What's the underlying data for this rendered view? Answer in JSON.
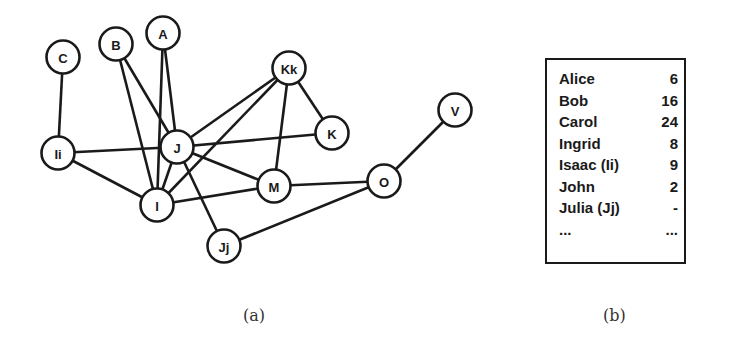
{
  "figure": {
    "panel_a": {
      "caption": "(a)",
      "nodes": [
        {
          "id": "C",
          "label": "C",
          "x": 63,
          "y": 57
        },
        {
          "id": "B",
          "label": "B",
          "x": 116,
          "y": 44
        },
        {
          "id": "A",
          "label": "A",
          "x": 163,
          "y": 33
        },
        {
          "id": "Ii",
          "label": "Ii",
          "x": 58,
          "y": 153
        },
        {
          "id": "J",
          "label": "J",
          "x": 177,
          "y": 147
        },
        {
          "id": "I",
          "label": "I",
          "x": 157,
          "y": 205
        },
        {
          "id": "Kk",
          "label": "Kk",
          "x": 289,
          "y": 68
        },
        {
          "id": "K",
          "label": "K",
          "x": 332,
          "y": 133
        },
        {
          "id": "M",
          "label": "M",
          "x": 274,
          "y": 186
        },
        {
          "id": "O",
          "label": "O",
          "x": 384,
          "y": 181
        },
        {
          "id": "V",
          "label": "V",
          "x": 455,
          "y": 110
        },
        {
          "id": "Jj",
          "label": "Jj",
          "x": 224,
          "y": 246
        }
      ],
      "edges": [
        [
          "C",
          "Ii"
        ],
        [
          "B",
          "J"
        ],
        [
          "B",
          "I"
        ],
        [
          "A",
          "J"
        ],
        [
          "A",
          "I"
        ],
        [
          "Ii",
          "J"
        ],
        [
          "Ii",
          "I"
        ],
        [
          "J",
          "Kk"
        ],
        [
          "J",
          "K"
        ],
        [
          "J",
          "M"
        ],
        [
          "J",
          "Jj"
        ],
        [
          "J",
          "I"
        ],
        [
          "I",
          "Kk"
        ],
        [
          "I",
          "M"
        ],
        [
          "Kk",
          "K"
        ],
        [
          "Kk",
          "M"
        ],
        [
          "M",
          "O"
        ],
        [
          "Jj",
          "O"
        ],
        [
          "O",
          "V"
        ]
      ]
    },
    "panel_b": {
      "caption": "(b)",
      "rows": [
        {
          "name": "Alice",
          "value": "6"
        },
        {
          "name": "Bob",
          "value": "16"
        },
        {
          "name": "Carol",
          "value": "24"
        },
        {
          "name": "Ingrid",
          "value": "8"
        },
        {
          "name": "Isaac (Ii)",
          "value": "9"
        },
        {
          "name": "John",
          "value": "2"
        },
        {
          "name": "Julia (Jj)",
          "value": "-"
        },
        {
          "name": "...",
          "value": "..."
        }
      ]
    }
  }
}
